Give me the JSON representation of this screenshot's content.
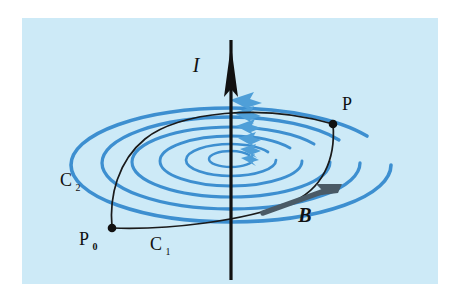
{
  "figure": {
    "kind": "physics-diagram",
    "panel": {
      "background_color": "#cdeaf7",
      "x": 22,
      "y": 18,
      "width": 416,
      "height": 266
    },
    "colors": {
      "panel_background": "#cdeaf7",
      "field_line_blue": "#3d8fd0",
      "field_line_blue_light": "#6fb4e3",
      "wire_black": "#111111",
      "path_black": "#1a1a1a",
      "b_arrow_gray": "#4a5a66",
      "page_white": "#ffffff"
    }
  },
  "labels": {
    "current": {
      "text": "I",
      "style": "italic",
      "x": 196,
      "y": 72,
      "font_size": 20,
      "meaning": "electric current in the wire"
    },
    "field": {
      "text": "B",
      "style": "bold-italic",
      "x": 305,
      "y": 222,
      "font_size": 20,
      "meaning": "magnetic field vector"
    },
    "point_p": {
      "text": "P",
      "style": "roman",
      "x": 344,
      "y": 110,
      "font_size": 18,
      "meaning": "end point of both paths"
    },
    "point_p0": {
      "base": "P",
      "subscript": "0",
      "text": "P0",
      "style": "roman",
      "x": 88,
      "y": 243,
      "font_size": 18,
      "meaning": "start point of both paths"
    },
    "curve_c1": {
      "base": "C",
      "subscript": "1",
      "text": "C1",
      "style": "roman",
      "x": 158,
      "y": 248,
      "font_size": 18,
      "meaning": "lower path from P0 to P"
    },
    "curve_c2": {
      "base": "C",
      "subscript": "2",
      "text": "C2",
      "style": "roman",
      "x": 68,
      "y": 184,
      "font_size": 18,
      "meaning": "upper path from P0 to P"
    }
  },
  "elements": {
    "wire": {
      "name": "vertical-current-wire",
      "x": 231,
      "y_top": 40,
      "y_bottom": 278,
      "arrow_tip_y": 72,
      "arrow_direction": "up",
      "stroke_width": 3
    },
    "field_ellipses": [
      {
        "cx": 231,
        "cy": 165,
        "rx": 160,
        "ry": 57,
        "stroke_width": 3.4
      },
      {
        "cx": 231,
        "cy": 163,
        "rx": 129,
        "ry": 46,
        "stroke_width": 3.2
      },
      {
        "cx": 231,
        "cy": 162,
        "rx": 99,
        "ry": 35,
        "stroke_width": 3.0
      },
      {
        "cx": 231,
        "cy": 161,
        "rx": 71,
        "ry": 25,
        "stroke_width": 2.8
      },
      {
        "cx": 231,
        "cy": 160,
        "rx": 45,
        "ry": 16,
        "stroke_width": 2.6
      },
      {
        "cx": 231,
        "cy": 159,
        "rx": 22,
        "ry": 8,
        "stroke_width": 2.4
      }
    ],
    "field_direction_arrowheads": {
      "count": 6,
      "direction": "left",
      "note": "blue arrowheads stacked vertically just right of the wire, one per ellipse"
    },
    "b_arrow": {
      "name": "b-field-vector-arrow",
      "from_x": 262,
      "from_y": 212,
      "to_x": 337,
      "to_y": 186,
      "color": "#4a5a66"
    },
    "path_c1": {
      "name": "lower-path",
      "from": "P0",
      "to": "P",
      "description": "black curve running from P0 along the bottom, rightwards and up to P"
    },
    "path_c2": {
      "name": "upper-path",
      "from": "P0",
      "to": "P",
      "description": "black curve running from P0 up and over the top of the ellipses to P"
    },
    "dots": [
      {
        "name": "point-p0-dot",
        "cx": 112,
        "cy": 228,
        "r": 4.2
      },
      {
        "name": "point-p-dot",
        "cx": 333,
        "cy": 124,
        "r": 4.2
      }
    ]
  }
}
